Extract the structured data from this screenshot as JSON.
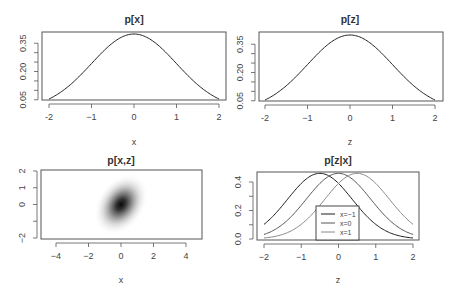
{
  "chart_data": [
    {
      "id": "px",
      "type": "line",
      "title": "p[x]",
      "xlabel": "x",
      "ylabel": "",
      "xlim": [
        -2,
        2
      ],
      "ylim": [
        0.05,
        0.4
      ],
      "xticks": [
        -2,
        -1,
        0,
        1,
        2
      ],
      "xtick_labels": [
        "-2",
        "−1",
        "0",
        "1",
        "2"
      ],
      "yticks": [
        0.05,
        0.2,
        0.35
      ],
      "ytick_labels": [
        "0.05",
        "0.20",
        "0.35"
      ],
      "yminor_ticks": [
        0.05,
        0.1,
        0.15,
        0.2,
        0.25,
        0.3,
        0.35
      ],
      "grid": false,
      "series": [
        {
          "name": "p[x]",
          "distribution": "normal",
          "mean": 0,
          "sd": 1,
          "color": "#222222",
          "x": [
            -2,
            -1.5,
            -1,
            -0.5,
            0,
            0.5,
            1,
            1.5,
            2
          ],
          "y": [
            0.054,
            0.13,
            0.242,
            0.352,
            0.399,
            0.352,
            0.242,
            0.13,
            0.054
          ]
        }
      ],
      "box": {
        "left": 42,
        "top": 32,
        "right": 226,
        "bottom": 100
      },
      "xpix": {
        "v0": -2,
        "p0": 49,
        "v1": 2,
        "p1": 219
      },
      "ypix": {
        "v0": 0.054,
        "p0": 99,
        "v1": 0.399,
        "p1": 34
      }
    },
    {
      "id": "pz",
      "type": "line",
      "title": "p[z]",
      "xlabel": "z",
      "ylabel": "",
      "xlim": [
        -2,
        2
      ],
      "ylim": [
        0.05,
        0.4
      ],
      "xticks": [
        -2,
        -1,
        0,
        1,
        2
      ],
      "xtick_labels": [
        "-2",
        "−1",
        "0",
        "1",
        "2"
      ],
      "yticks": [
        0.05,
        0.2,
        0.35
      ],
      "ytick_labels": [
        "0.05",
        "0.20",
        "0.35"
      ],
      "yminor_ticks": [
        0.05,
        0.1,
        0.15,
        0.2,
        0.25,
        0.3,
        0.35
      ],
      "grid": false,
      "series": [
        {
          "name": "p[z]",
          "distribution": "normal",
          "mean": 0,
          "sd": 1,
          "color": "#222222",
          "x": [
            -2,
            -1.5,
            -1,
            -0.5,
            0,
            0.5,
            1,
            1.5,
            2
          ],
          "y": [
            0.054,
            0.13,
            0.242,
            0.352,
            0.399,
            0.352,
            0.242,
            0.13,
            0.054
          ]
        }
      ],
      "box": {
        "left": 259,
        "top": 32,
        "right": 443,
        "bottom": 101
      },
      "xpix": {
        "v0": -2,
        "p0": 265,
        "v1": 2,
        "p1": 435
      },
      "ypix": {
        "v0": 0.054,
        "p0": 100,
        "v1": 0.399,
        "p1": 35
      }
    },
    {
      "id": "pxz",
      "type": "heatmap",
      "title": "p[x,z]",
      "xlabel": "x",
      "ylabel": "",
      "xlim": [
        -5,
        5
      ],
      "ylim": [
        -2,
        2
      ],
      "xticks": [
        -4,
        -2,
        0,
        2,
        4
      ],
      "xtick_labels": [
        "−4",
        "−2",
        "0",
        "2",
        "4"
      ],
      "yticks": [
        -2,
        -1,
        0,
        1,
        2
      ],
      "ytick_labels": [
        "−2",
        "",
        "0",
        "1",
        "2"
      ],
      "grid": false,
      "density": {
        "distribution": "bivariate normal",
        "mean": [
          0,
          0
        ],
        "sd_x": 1,
        "sd_z": 1,
        "correlation": 0.5,
        "colormap": "white-to-black"
      },
      "box": {
        "left": 41,
        "top": 170,
        "right": 202,
        "bottom": 239
      },
      "xpix": {
        "v0": -4,
        "p0": 56,
        "v1": 4,
        "p1": 186
      },
      "ypix": {
        "v0": -2,
        "p0": 238,
        "v1": 2,
        "p1": 171
      }
    },
    {
      "id": "pz_given_x",
      "type": "line",
      "title": "p[z|x]",
      "xlabel": "z",
      "ylabel": "",
      "xlim": [
        -2,
        2
      ],
      "ylim": [
        0,
        0.46
      ],
      "xticks": [
        -2,
        -1,
        0,
        1,
        2
      ],
      "xtick_labels": [
        "−2",
        "−1",
        "0",
        "1",
        "2"
      ],
      "yticks": [
        0,
        0.1,
        0.2,
        0.3,
        0.4
      ],
      "ytick_labels": [
        "0.0",
        "",
        "0.2",
        "",
        "0.4"
      ],
      "grid": false,
      "legend": {
        "position": "bottom-center",
        "entries": [
          "x=−1",
          "x=0",
          "x=1"
        ]
      },
      "series": [
        {
          "name": "x=−1",
          "distribution": "normal",
          "mean": -0.5,
          "sd": 0.866,
          "color": "#1a1a1a",
          "x": [
            -2,
            -1.5,
            -1,
            -0.5,
            0,
            0.5,
            1,
            1.5,
            2
          ],
          "y": [
            0.104,
            0.237,
            0.391,
            0.461,
            0.391,
            0.237,
            0.104,
            0.033,
            0.008
          ]
        },
        {
          "name": "x=0",
          "distribution": "normal",
          "mean": 0,
          "sd": 0.866,
          "color": "#555555",
          "x": [
            -2,
            -1.5,
            -1,
            -0.5,
            0,
            0.5,
            1,
            1.5,
            2
          ],
          "y": [
            0.032,
            0.103,
            0.236,
            0.39,
            0.461,
            0.39,
            0.236,
            0.103,
            0.032
          ]
        },
        {
          "name": "x=1",
          "distribution": "normal",
          "mean": 0.5,
          "sd": 0.866,
          "color": "#888888",
          "x": [
            -2,
            -1.5,
            -1,
            -0.5,
            0,
            0.5,
            1,
            1.5,
            2
          ],
          "y": [
            0.008,
            0.033,
            0.104,
            0.237,
            0.391,
            0.461,
            0.391,
            0.237,
            0.104
          ]
        }
      ],
      "box": {
        "left": 257,
        "top": 172,
        "right": 419,
        "bottom": 240
      },
      "xpix": {
        "v0": -2,
        "p0": 264,
        "v1": 2,
        "p1": 413
      },
      "ypix": {
        "v0": 0,
        "p0": 239,
        "v1": 0.4,
        "p1": 182
      },
      "legend_box": {
        "left": 316,
        "top": 206,
        "right": 359,
        "bottom": 240
      }
    }
  ]
}
